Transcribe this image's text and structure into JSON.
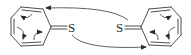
{
  "diagram": {
    "type": "chemical-reaction-mechanism",
    "molecules": [
      {
        "name": "cycloheptatrienethione-left",
        "ring_size": 7,
        "exocyclic_atom": "S",
        "double_bond_to": "S"
      },
      {
        "name": "cycloheptatrienethione-right",
        "ring_size": 7,
        "exocyclic_atom": "S",
        "double_bond_to": "S"
      }
    ],
    "labels": {
      "left_sulfur": "S",
      "right_sulfur": "S"
    },
    "arrows": [
      {
        "name": "top-arrow",
        "from": "right sulfur",
        "to": "left ring"
      },
      {
        "name": "bottom-arrow",
        "from": "left sulfur",
        "to": "right ring"
      }
    ],
    "internal_arrows_per_ring": 3
  }
}
